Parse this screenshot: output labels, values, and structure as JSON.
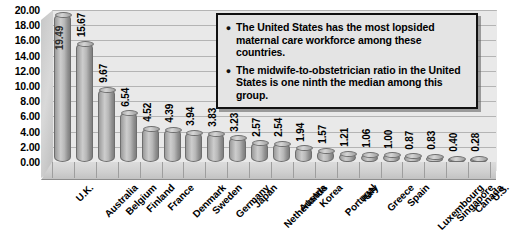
{
  "chart_data": {
    "type": "bar",
    "title": "",
    "subtitle": "",
    "xlabel": "",
    "ylabel": "",
    "ylim": [
      0,
      20
    ],
    "grid": true,
    "legend_position": "none",
    "style": "3d-cylinder",
    "y_ticks": [
      "20.00",
      "18.00",
      "16.00",
      "14.00",
      "12.00",
      "10.00",
      "8.00",
      "6.00",
      "4.00",
      "2.00",
      "0.00"
    ],
    "y_tick_values": [
      20,
      18,
      16,
      14,
      12,
      10,
      8,
      6,
      4,
      2,
      0
    ],
    "categories": [
      "U.K.",
      "Australia",
      "Belgium",
      "Finland",
      "France",
      "Denmark",
      "Sweden",
      "Germany",
      "Japan",
      "Netherlands",
      "Austria",
      "Korea",
      "Portugal",
      "Italy",
      "Greece",
      "Spain",
      "Luxembourg",
      "Singapore",
      "Canada",
      "U.S."
    ],
    "values": [
      19.49,
      15.67,
      9.67,
      6.54,
      4.52,
      4.39,
      3.94,
      3.83,
      3.23,
      2.57,
      2.54,
      1.94,
      1.57,
      1.21,
      1.06,
      1.0,
      0.87,
      0.83,
      0.4,
      0.28
    ],
    "data_labels": [
      "19.49",
      "15.67",
      "9.67",
      "6.54",
      "4.52",
      "4.39",
      "3.94",
      "3.83",
      "3.23",
      "2.57",
      "2.54",
      "1.94",
      "1.57",
      "1.21",
      "1.06",
      "1.00",
      "0.87",
      "0.83",
      "0.40",
      "0.28"
    ],
    "annotations": [
      "The United States has the most lopsided maternal care workforce among these countries.",
      "The midwife-to-obstetrician ratio in the United States is one ninth the median among this group."
    ],
    "colors": {
      "bar": "#b0b0b0",
      "bar_edge": "#6e6e6e",
      "plot_background": "#e9e9e9",
      "gridline": "#b4b4b4",
      "floor": "#cfcfcf",
      "callout_background": "#e4e4e4",
      "callout_border": "#111111",
      "text": "#000000"
    }
  },
  "callout": {
    "bullet_glyph": "●",
    "items": [
      "The United States has the most lopsided maternal care workforce among these countries.",
      "The midwife-to-obstetrician ratio in the United States is one ninth the median among this group."
    ]
  }
}
